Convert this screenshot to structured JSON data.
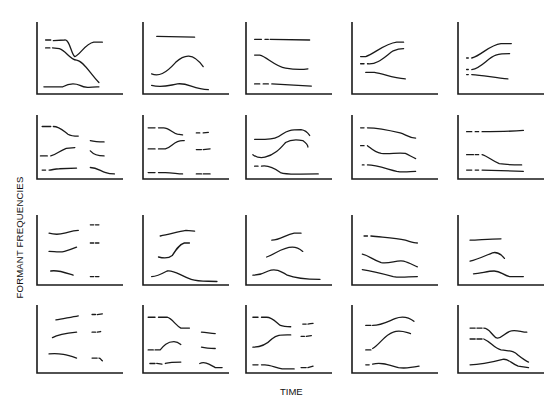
{
  "figure": {
    "ylabel": "FORMANT FREQUENCIES",
    "xlabel": "TIME",
    "stroke_color": "#1a1a1a"
  },
  "panels": [
    {
      "x": 37,
      "y": 22,
      "w": 86,
      "h": 72,
      "curves": [
        {
          "d": "M10,25 L16,25 M19,26 L32,25 C38,23 40,46 44,48 C50,46 56,30 66,28 L76,28",
          "dash": false
        },
        {
          "d": "M10,36 L15,36 M18,36 L26,37 C34,40 38,52 46,53 C54,54 62,72 72,84",
          "dash": false
        },
        {
          "d": "M8,90 L30,90 C36,86 42,84 50,88 C56,92 62,91 72,90",
          "dash": false
        }
      ]
    },
    {
      "x": 143,
      "y": 22,
      "w": 86,
      "h": 72,
      "curves": [
        {
          "d": "M16,20 L60,21",
          "dash": false
        },
        {
          "d": "M10,72 C18,76 26,72 38,56 C48,45 58,42 70,62",
          "dash": false
        },
        {
          "d": "M10,88 C22,92 30,88 40,86 C52,84 58,93 76,94",
          "dash": false
        }
      ]
    },
    {
      "x": 246,
      "y": 22,
      "w": 86,
      "h": 72,
      "curves": [
        {
          "d": "M10,24 L18,24 M22,24 L26,24 M28,24 L74,25",
          "dash": false
        },
        {
          "d": "M10,46 L16,46 C24,48 34,62 46,64 C56,66 66,66 72,65",
          "dash": false
        },
        {
          "d": "M10,86 L16,86 M20,86 L26,86 M30,86 L76,89",
          "dash": false
        }
      ]
    },
    {
      "x": 352,
      "y": 22,
      "w": 86,
      "h": 72,
      "curves": [
        {
          "d": "M10,48 L16,48 C26,44 38,30 52,28 L60,28",
          "dash": false
        },
        {
          "d": "M10,58 L14,58 M18,58 C30,60 40,46 48,40 C54,37 58,37 60,37",
          "dash": false
        },
        {
          "d": "M16,70 L26,70 C38,72 46,78 62,79",
          "dash": false
        }
      ]
    },
    {
      "x": 458,
      "y": 22,
      "w": 86,
      "h": 72,
      "curves": [
        {
          "d": "M10,50 L12,50 M16,50 C28,46 36,32 50,30 L62,30",
          "dash": false
        },
        {
          "d": "M10,66 L12,66 M16,66 C28,64 34,50 44,46 C50,44 56,44 60,44",
          "dash": false
        },
        {
          "d": "M10,73 L12,73 M16,73 C30,74 44,78 58,79",
          "dash": false
        }
      ]
    },
    {
      "x": 37,
      "y": 115,
      "w": 86,
      "h": 64,
      "curves": [
        {
          "d": "M6,18 L16,18 M19,18 C26,18 30,24 36,30 C40,33 44,33 48,33",
          "dash": false
        },
        {
          "d": "M62,40 C68,42 72,42 78,42",
          "dash": false
        },
        {
          "d": "M4,64 L12,64 M16,64 C22,62 26,56 34,52 L44,51",
          "dash": false
        },
        {
          "d": "M62,56 C66,62 72,64 78,64",
          "dash": false
        },
        {
          "d": "M6,86 L10,86 M14,86 C18,86 20,84 26,84 L46,83",
          "dash": false
        },
        {
          "d": "M62,82 C70,82 74,88 80,90 C84,92 86,92 90,92",
          "dash": false
        }
      ]
    },
    {
      "x": 143,
      "y": 115,
      "w": 86,
      "h": 64,
      "curves": [
        {
          "d": "M6,20 L14,20 M18,20 L24,20 C30,20 34,28 40,30 L46,31",
          "dash": false
        },
        {
          "d": "M62,28 L66,28 M70,28 L76,27",
          "dash": false
        },
        {
          "d": "M6,53 L14,53 M18,53 L26,53 C34,50 36,40 46,40 L48,40",
          "dash": false
        },
        {
          "d": "M62,54 L68,54 M70,54 L78,53",
          "dash": false
        },
        {
          "d": "M6,90 L14,90 M18,90 L26,90 C34,90 40,92 46,92",
          "dash": false
        },
        {
          "d": "M62,92 L68,92 M70,92 L78,92",
          "dash": false
        }
      ]
    },
    {
      "x": 246,
      "y": 115,
      "w": 86,
      "h": 64,
      "curves": [
        {
          "d": "M10,38 L22,38 C32,38 36,36 42,30 C48,24 52,23 64,23 C70,24 72,28 74,32",
          "dash": false
        },
        {
          "d": "M8,62 C12,66 16,68 22,66 C34,62 40,52 46,43 C52,38 58,38 66,40 C70,44 72,48 72,50",
          "dash": false
        },
        {
          "d": "M10,80 L14,80 M18,80 C26,78 34,84 40,90 C48,94 56,92 84,92",
          "dash": false
        }
      ]
    },
    {
      "x": 352,
      "y": 115,
      "w": 86,
      "h": 64,
      "curves": [
        {
          "d": "M10,20 L14,20 M18,20 C30,20 44,24 56,28 C62,30 66,36 74,36",
          "dash": false
        },
        {
          "d": "M10,48 L14,48 M18,48 C22,52 26,58 34,60 C44,62 52,58 62,60 C66,62 70,66 74,68",
          "dash": false
        },
        {
          "d": "M12,78 L14,78 M18,78 C28,78 40,84 52,88 C60,90 68,88 74,88",
          "dash": false
        }
      ]
    },
    {
      "x": 458,
      "y": 115,
      "w": 86,
      "h": 64,
      "curves": [
        {
          "d": "M10,26 L16,26 M20,26 L24,26 M28,26 C40,26 60,26 76,24",
          "dash": false
        },
        {
          "d": "M10,62 L18,62 M20,62 L24,62 M28,62 C34,64 40,72 48,76 C58,78 68,78 74,78",
          "dash": false
        },
        {
          "d": "M10,86 L16,86 M20,86 L24,86 M28,86 L76,88",
          "dash": false
        }
      ]
    },
    {
      "x": 37,
      "y": 215,
      "w": 86,
      "h": 70,
      "curves": [
        {
          "d": "M14,26 C20,28 26,28 32,26 C38,24 42,22 48,22",
          "dash": false
        },
        {
          "d": "M62,14 L66,14 M68,14 L72,14",
          "dash": false
        },
        {
          "d": "M14,52 C20,52 26,54 32,52 C38,50 42,48 46,46",
          "dash": false
        },
        {
          "d": "M62,40 L66,40 M68,40 L72,40",
          "dash": false
        },
        {
          "d": "M16,80 C24,78 32,82 42,86",
          "dash": false
        },
        {
          "d": "M62,88 L66,88 M68,88 L72,88",
          "dash": false
        }
      ]
    },
    {
      "x": 143,
      "y": 215,
      "w": 86,
      "h": 70,
      "curves": [
        {
          "d": "M20,30 C30,28 40,24 50,22 L60,23",
          "dash": false
        },
        {
          "d": "M18,60 C24,62 30,62 34,58 C38,50 42,42 48,40 L54,40",
          "dash": false
        },
        {
          "d": "M10,88 C16,88 22,84 28,80 C36,78 42,86 56,92 C66,96 76,94 86,95",
          "dash": false
        }
      ]
    },
    {
      "x": 246,
      "y": 215,
      "w": 86,
      "h": 70,
      "curves": [
        {
          "d": "M30,36 C40,36 46,28 56,26 L64,26",
          "dash": false
        },
        {
          "d": "M24,60 C34,56 42,46 54,46 C60,46 64,50 66,52",
          "dash": false
        },
        {
          "d": "M8,86 C14,86 20,84 26,80 C34,76 40,80 48,86 C56,90 70,92 86,92",
          "dash": false
        }
      ]
    },
    {
      "x": 352,
      "y": 215,
      "w": 86,
      "h": 70,
      "curves": [
        {
          "d": "M14,30 L18,30 M22,30 C36,32 50,32 62,36 C68,38 72,40 76,40",
          "dash": false
        },
        {
          "d": "M12,56 C20,58 24,64 34,68 C44,70 52,64 60,66 C66,68 72,72 76,74",
          "dash": false
        },
        {
          "d": "M12,78 C24,80 36,84 48,88 C56,90 66,88 76,88",
          "dash": false
        }
      ]
    },
    {
      "x": 458,
      "y": 215,
      "w": 86,
      "h": 70,
      "curves": [
        {
          "d": "M14,36 C24,36 34,34 50,34",
          "dash": false
        },
        {
          "d": "M14,66 C22,64 32,58 40,54 C46,52 50,56 54,62",
          "dash": false
        },
        {
          "d": "M18,84 C26,84 34,80 42,80 C50,80 52,86 60,88 L76,88",
          "dash": false
        }
      ]
    },
    {
      "x": 37,
      "y": 305,
      "w": 86,
      "h": 68,
      "curves": [
        {
          "d": "M22,22 C30,20 40,18 48,16",
          "dash": false
        },
        {
          "d": "M64,14 L68,14 M70,14 L76,13",
          "dash": false
        },
        {
          "d": "M18,48 C24,44 32,42 46,40",
          "dash": false
        },
        {
          "d": "M64,40 L68,40 M70,40 L74,39",
          "dash": false
        },
        {
          "d": "M14,72 C26,70 36,74 46,78",
          "dash": false
        },
        {
          "d": "M64,78 L70,78 M72,78 C74,78 74,80 76,82",
          "dash": false
        }
      ]
    },
    {
      "x": 143,
      "y": 305,
      "w": 86,
      "h": 68,
      "curves": [
        {
          "d": "M6,18 L14,18 M18,18 L28,18 C34,20 38,30 44,34 L54,34",
          "dash": false
        },
        {
          "d": "M68,40 C74,40 78,42 84,42",
          "dash": false
        },
        {
          "d": "M6,66 L12,66 M14,66 L20,66 C24,60 28,54 36,54 C40,54 42,56 44,58",
          "dash": false
        },
        {
          "d": "M68,62 C74,64 78,64 84,64",
          "dash": false
        },
        {
          "d": "M8,86 L14,86 M16,86 L22,87 M26,86 C32,84 38,84 44,84",
          "dash": false
        },
        {
          "d": "M66,86 C72,82 78,88 84,92 L92,92",
          "dash": false
        }
      ]
    },
    {
      "x": 246,
      "y": 305,
      "w": 86,
      "h": 68,
      "curves": [
        {
          "d": "M8,18 L14,18 M18,18 L24,18 C30,18 34,24 40,30 C44,32 48,32 52,32",
          "dash": false
        },
        {
          "d": "M66,28 L70,28 M72,28 C74,28 76,27 78,27",
          "dash": false
        },
        {
          "d": "M8,62 C16,62 24,58 30,50 C36,44 40,44 48,44 L52,44",
          "dash": false
        },
        {
          "d": "M64,46 L68,46 M70,46 L76,45",
          "dash": false
        },
        {
          "d": "M8,88 L14,88 M18,88 L22,88 C28,88 34,92 42,94 C48,94 52,94 56,94",
          "dash": false
        },
        {
          "d": "M64,92 L70,92 M72,92 L78,90",
          "dash": false
        }
      ]
    },
    {
      "x": 352,
      "y": 305,
      "w": 86,
      "h": 68,
      "curves": [
        {
          "d": "M16,30 L22,30 M24,30 C34,30 42,24 50,20 C58,16 66,18 72,24",
          "dash": false
        },
        {
          "d": "M16,66 L22,66 M24,64 C32,58 38,44 48,40 C56,36 62,40 68,42",
          "dash": false
        },
        {
          "d": "M16,88 L20,88 M24,87 C34,84 42,88 54,92 C62,94 70,92 78,90",
          "dash": false
        }
      ]
    },
    {
      "x": 458,
      "y": 305,
      "w": 86,
      "h": 68,
      "curves": [
        {
          "d": "M14,34 L20,34 M22,34 L28,34 M30,34 C36,34 38,42 44,48 C50,52 54,40 62,38 C68,36 74,40 80,40",
          "dash": false
        },
        {
          "d": "M14,50 L20,50 M22,50 L28,50 M30,50 C38,54 42,64 50,66 C60,68 64,66 70,74 C74,78 78,82 82,84",
          "dash": false
        },
        {
          "d": "M14,88 C28,88 40,84 52,80 C58,78 62,86 70,90 L82,92",
          "dash": false
        }
      ]
    }
  ]
}
